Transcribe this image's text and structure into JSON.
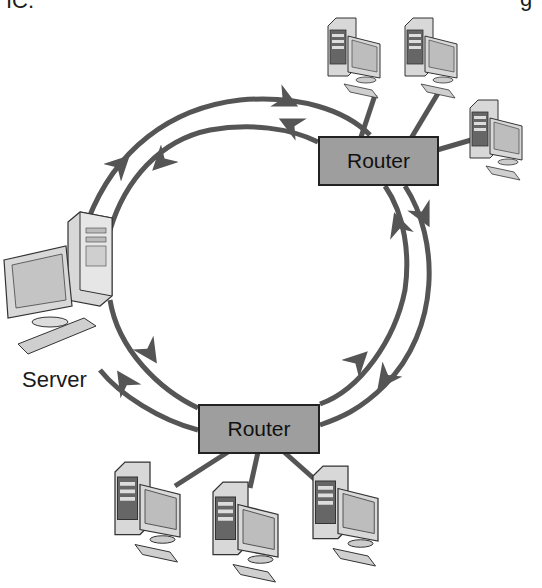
{
  "figure": {
    "cropped_text_top_left": "IC.",
    "cropped_text_top_right": "g"
  },
  "nodes": {
    "server": {
      "label": "Server"
    },
    "router_top": {
      "label": "Router"
    },
    "router_bottom": {
      "label": "Router"
    },
    "clients_top_count": 3,
    "clients_bottom_count": 3
  },
  "ring": {
    "outer_direction": "clockwise",
    "inner_direction": "counterclockwise",
    "line_color": "#555555"
  },
  "colors": {
    "router_fill": "#9e9e9e",
    "line": "#555555",
    "background": "#ffffff"
  }
}
